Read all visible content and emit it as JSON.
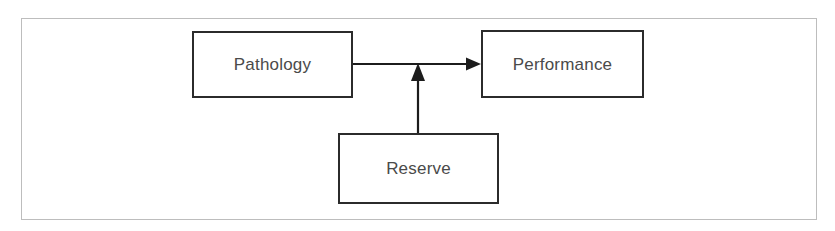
{
  "figure": {
    "type": "flow-diagram",
    "background_color": "#ffffff",
    "frame_color": "#bdbdbd",
    "box_border_color": "#2b2b2b",
    "connector_color": "#1c1c1c",
    "label_color": "#4a4a4a"
  },
  "nodes": [
    {
      "id": "pathology",
      "label": "Pathology",
      "x": 192,
      "y": 31,
      "width": 161,
      "height": 67
    },
    {
      "id": "performance",
      "label": "Performance",
      "x": 481,
      "y": 30,
      "width": 163,
      "height": 68
    },
    {
      "id": "reserve",
      "label": "Reserve",
      "x": 338,
      "y": 133,
      "width": 161,
      "height": 71
    }
  ],
  "edges": [
    {
      "id": "pathology-to-performance",
      "from": "pathology",
      "to": "performance",
      "direction": "right",
      "arrowhead": "filled-triangle"
    },
    {
      "id": "reserve-to-link",
      "from": "reserve",
      "to": "pathology-to-performance",
      "direction": "up",
      "arrowhead": "filled-triangle"
    }
  ]
}
